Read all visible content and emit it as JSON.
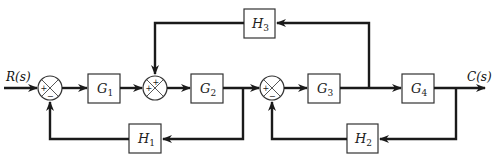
{
  "diagram": {
    "type": "control-system-block-diagram",
    "input_signal": "R(s)",
    "output_signal": "C(s)",
    "blocks": [
      {
        "id": "G1",
        "name": "G",
        "sub": "1",
        "path": "forward"
      },
      {
        "id": "G2",
        "name": "G",
        "sub": "2",
        "path": "forward"
      },
      {
        "id": "G3",
        "name": "G",
        "sub": "3",
        "path": "forward"
      },
      {
        "id": "G4",
        "name": "G",
        "sub": "4",
        "path": "forward"
      },
      {
        "id": "H1",
        "name": "H",
        "sub": "1",
        "path": "feedback"
      },
      {
        "id": "H2",
        "name": "H",
        "sub": "2",
        "path": "feedback"
      },
      {
        "id": "H3",
        "name": "H",
        "sub": "3",
        "path": "feedback"
      }
    ],
    "summing_junctions": [
      {
        "id": "S1",
        "signs": {
          "left": "+",
          "bottom": "−"
        }
      },
      {
        "id": "S2",
        "signs": {
          "left": "+",
          "top": "+"
        }
      },
      {
        "id": "S3",
        "signs": {
          "left": "+",
          "bottom": "−"
        }
      }
    ],
    "connections": [
      "R(s) → S1(+)",
      "S1 → G1",
      "G1 → S2(+)",
      "S2 → G2",
      "G2 → S3(+)",
      "G2 output → H1 → S1(−)",
      "S3 → G3",
      "G3 → G4",
      "G3 output → H3 → S2(+)",
      "G4 → C(s)",
      "C(s) → H2 → S3(−)"
    ]
  }
}
